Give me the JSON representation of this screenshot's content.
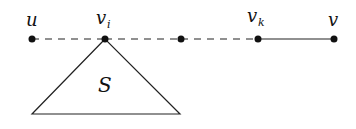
{
  "diagram": {
    "nodes": [
      {
        "id": "u",
        "label": "u",
        "sub": "",
        "x": 32,
        "y": 39
      },
      {
        "id": "vi",
        "label": "v",
        "sub": "i",
        "x": 105,
        "y": 39
      },
      {
        "id": "mid",
        "label": "",
        "sub": "",
        "x": 181,
        "y": 39
      },
      {
        "id": "vk",
        "label": "v",
        "sub": "k",
        "x": 258,
        "y": 39
      },
      {
        "id": "v",
        "label": "v",
        "sub": "",
        "x": 334,
        "y": 39
      }
    ],
    "edges": [
      {
        "from": "u",
        "to": "vi",
        "style": "dashed"
      },
      {
        "from": "vi",
        "to": "mid",
        "style": "dashed"
      },
      {
        "from": "mid",
        "to": "vk",
        "style": "dashed"
      },
      {
        "from": "vk",
        "to": "v",
        "style": "solid"
      }
    ],
    "subtree": {
      "label": "S",
      "apex": "vi"
    }
  }
}
